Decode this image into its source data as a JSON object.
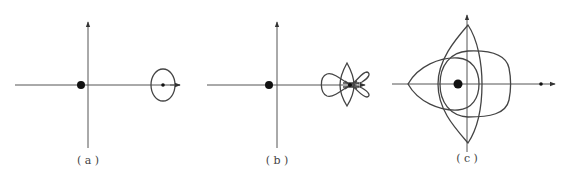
{
  "figure": {
    "panels": [
      {
        "id": "a",
        "label": "( a )"
      },
      {
        "id": "b",
        "label": "( b )"
      },
      {
        "id": "c",
        "label": "( c )"
      }
    ],
    "colors": {
      "line": "#444444",
      "axis": "#555555",
      "background": "#ffffff"
    }
  }
}
